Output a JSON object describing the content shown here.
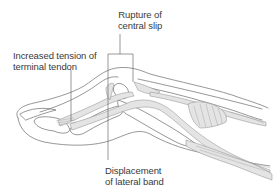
{
  "figure": {
    "colors": {
      "outline": "#6a6a6a",
      "tendon_fill": "#e4e4e4",
      "tendon_stroke": "#8a8a8a",
      "leader_line": "#555555",
      "text": "#3a3a3a",
      "background": "#ffffff"
    }
  },
  "labels": {
    "rupture": {
      "line1": "Rupture of",
      "line2": "central slip"
    },
    "tension": {
      "line1": "Increased tension of",
      "line2": "terminal tendon"
    },
    "displacement": {
      "line1": "Displacement",
      "line2": "of lateral band"
    }
  }
}
